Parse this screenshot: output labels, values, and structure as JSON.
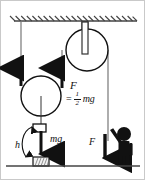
{
  "diagram": {
    "type": "physics-mechanics-diagram",
    "colors": {
      "stroke": "#111111",
      "line": "#555555",
      "fill_black": "#111111",
      "background": "#ffffff",
      "hatch": "#333333"
    },
    "ceiling": {
      "name": "ceiling-support",
      "x1": 14,
      "x2": 137,
      "y": 21,
      "hatch_count": 22
    },
    "ground": {
      "name": "ground-line",
      "x1": 6,
      "x2": 140,
      "y": 166
    },
    "fixed_pulley": {
      "name": "fixed-pulley",
      "cx": 87,
      "cy": 50,
      "r": 21,
      "bracket": {
        "x": 82,
        "y": 22,
        "w": 6,
        "h": 32
      }
    },
    "movable_pulley": {
      "name": "movable-pulley",
      "cx": 41,
      "cy": 96,
      "r": 20
    },
    "hanging_block": {
      "name": "hanging-mass-block",
      "x": 33,
      "y": 124,
      "w": 12,
      "h": 8
    },
    "ground_block": {
      "name": "landing-block",
      "x": 33,
      "y": 157,
      "w": 15,
      "h": 9
    },
    "person": {
      "name": "person-pulling-rope",
      "head_cx": 124,
      "head_cy": 134,
      "head_r": 7
    },
    "ropes": [
      {
        "name": "rope-left-anchor",
        "x": 21,
        "y1": 21,
        "y2": 80
      },
      {
        "name": "rope-over-fixed-pulley",
        "x": 62,
        "y1": 50,
        "y2": 82
      },
      {
        "name": "rope-to-person",
        "x": 108,
        "y1": 50,
        "y2": 140
      }
    ]
  },
  "labels": {
    "force_pulley": "F",
    "equals_sign": "=",
    "fraction_numerator": "1",
    "fraction_denominator": "2",
    "fraction_term": "mg",
    "weight": "mg",
    "height": "h",
    "force_person": "F"
  },
  "arrows": [
    {
      "name": "tension-arrow-left",
      "direction": "up",
      "x": 21,
      "y_tail": 85,
      "y_head": 64
    },
    {
      "name": "tension-arrow-right",
      "direction": "up",
      "x": 62,
      "y_tail": 86,
      "y_head": 64
    },
    {
      "name": "weight-arrow",
      "direction": "down",
      "x": 41,
      "y_tail": 130,
      "y_head": 158
    },
    {
      "name": "applied-force-arrow",
      "direction": "down",
      "x": 105,
      "y_tail": 133,
      "y_head": 162
    },
    {
      "name": "height-arc-arrow",
      "direction": "arc",
      "label": "h"
    }
  ]
}
